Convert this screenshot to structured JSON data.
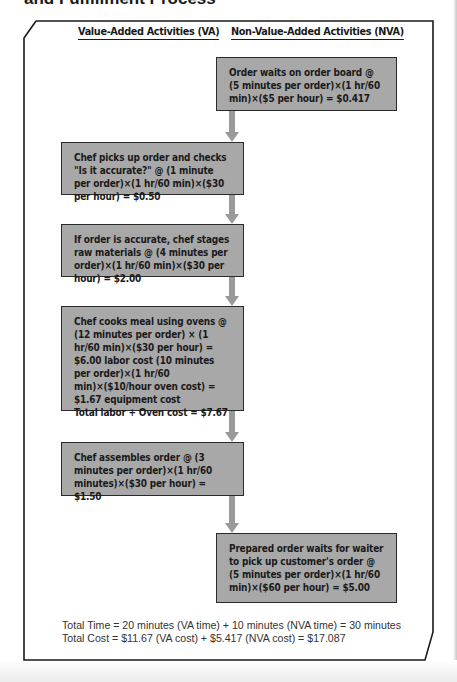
{
  "header": {
    "title": "and Fulfillment Process"
  },
  "columns": {
    "va": "Value-Added Activities (VA)",
    "nva": "Non-Value-Added Activities (NVA)"
  },
  "steps": [
    {
      "type": "NVA",
      "text": "Order waits on order board @ (5 minutes per order)×(1 hr/60 min)×($5 per hour) = $0.417"
    },
    {
      "type": "VA",
      "text": "Chef picks up order and checks  \"Is it accurate?\" @ (1 minute per order)×(1 hr/60 min)×($30 per hour) = $0.50"
    },
    {
      "type": "VA",
      "text": "If order is accurate, chef stages raw materials @ (4 minutes per order)×(1 hr/60 min)×($30 per hour) = $2.00"
    },
    {
      "type": "VA",
      "text": "Chef cooks meal using ovens @ (12 minutes per order) × (1 hr/60 min)×($30 per hour) = $6.00 labor cost (10 minutes per order)×(1 hr/60 min)×($10/hour oven cost) = $1.67 equipment cost",
      "total": "Total labor + Oven cost = $7.67"
    },
    {
      "type": "VA",
      "text": "Chef assembles order @ (3 minutes per order)×(1 hr/60 minutes)×($30 per hour) = $1.50"
    },
    {
      "type": "NVA",
      "text": "Prepared order waits for waiter to pick up customer's order @ (5 minutes per order)×(1 hr/60 min)×($60 per hour) = $5.00"
    }
  ],
  "totals": {
    "time": "Total Time = 20 minutes (VA time) + 10 minutes (NVA time) = 30 minutes",
    "cost": "Total Cost = $11.67 (VA cost) + $5.417 (NVA cost) = $17.087"
  },
  "colors": {
    "box_fill": "#a8a8a8",
    "box_border": "#2a2a2a",
    "arrow": "#9a9a9a",
    "frame": "#1a1a1a"
  }
}
